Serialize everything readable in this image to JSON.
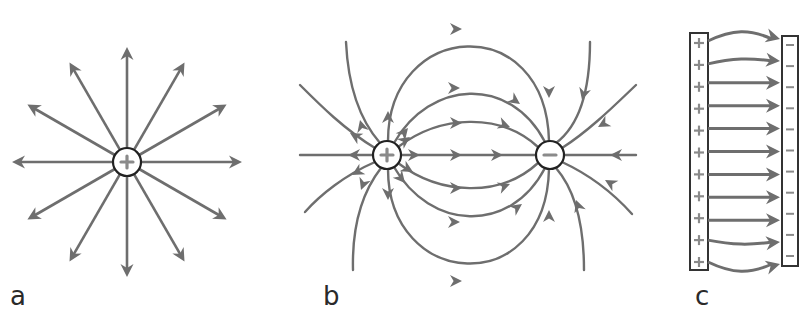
{
  "figure": {
    "colors": {
      "line": "#6e6e6e",
      "charge_outline": "#222222",
      "charge_symbol": "#8a8a8a",
      "plate_outline": "#333333",
      "background": "#ffffff"
    },
    "panels": [
      {
        "id": "a",
        "label": "a",
        "description": "Field lines radiating outward from a single positive point charge",
        "charge": {
          "sign": "+",
          "x": 127,
          "y": 162,
          "r": 14
        },
        "ray_count": 12,
        "ray_length": 115
      },
      {
        "id": "b",
        "label": "b",
        "description": "Electric dipole: field lines from positive charge to negative charge",
        "charges": [
          {
            "sign": "+",
            "x": 387,
            "y": 155,
            "r": 14
          },
          {
            "sign": "-",
            "x": 550,
            "y": 155,
            "r": 14
          }
        ]
      },
      {
        "id": "c",
        "label": "c",
        "description": "Parallel-plate capacitor: uniform field lines from positive plate to negative plate",
        "left_plate": {
          "sign": "+",
          "x": 690,
          "y": 33,
          "w": 18,
          "h": 237,
          "symbol_count": 11
        },
        "right_plate": {
          "sign": "-",
          "x": 782,
          "y": 33,
          "w": 16,
          "h": 233,
          "symbol_count": 11
        },
        "arrow_count": 11
      }
    ]
  }
}
